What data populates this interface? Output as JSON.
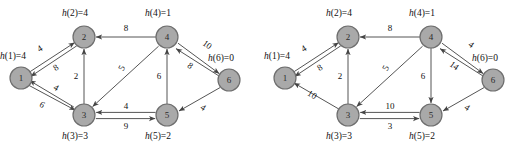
{
  "figure": {
    "caption": "",
    "node_fill": "#a9a9a9",
    "node_stroke": "#6e6e6e",
    "edge_color": "#555555"
  },
  "graphs": [
    {
      "id": "left",
      "nodes": [
        {
          "id": "1",
          "num": "1",
          "x": 21,
          "y": 78,
          "h_label": "h(1)=4",
          "label_x": 0,
          "label_y": 52
        },
        {
          "id": "2",
          "num": "2",
          "x": 84,
          "y": 37,
          "h_label": "h(2)=4",
          "label_x": 62,
          "label_y": 9
        },
        {
          "id": "3",
          "num": "3",
          "x": 84,
          "y": 115,
          "h_label": "h(3)=3",
          "label_x": 62,
          "label_y": 132
        },
        {
          "id": "4",
          "num": "4",
          "x": 167,
          "y": 37,
          "h_label": "h(4)=1",
          "label_x": 145,
          "label_y": 9
        },
        {
          "id": "5",
          "num": "5",
          "x": 167,
          "y": 115,
          "h_label": "h(5)=2",
          "label_x": 145,
          "label_y": 132
        },
        {
          "id": "6",
          "num": "6",
          "x": 229,
          "y": 80,
          "h_label": "h(6)=0",
          "label_x": 208,
          "label_y": 54
        }
      ],
      "edges": [
        {
          "from": "1",
          "to": "2",
          "weight": "4",
          "wx": 40,
          "wy": 49,
          "rot": -33
        },
        {
          "from": "2",
          "to": "1",
          "weight": "8",
          "wx": 56,
          "wy": 68,
          "rot": -33
        },
        {
          "from": "1",
          "to": "3",
          "weight": "6",
          "wx": 42,
          "wy": 105,
          "rot": 31
        },
        {
          "from": "3",
          "to": "1",
          "weight": "4",
          "wx": 56,
          "wy": 88,
          "rot": 31
        },
        {
          "from": "3",
          "to": "2",
          "weight": "2",
          "wx": 76,
          "wy": 76,
          "rot": 0
        },
        {
          "from": "4",
          "to": "2",
          "weight": "8",
          "wx": 126,
          "wy": 28,
          "rot": 0
        },
        {
          "from": "4",
          "to": "3",
          "weight": "5",
          "wx": 122,
          "wy": 68,
          "rot": -63
        },
        {
          "from": "5",
          "to": "4",
          "weight": "6",
          "wx": 159,
          "wy": 76,
          "rot": 0
        },
        {
          "from": "4",
          "to": "6",
          "weight": "10",
          "wx": 207,
          "wy": 45,
          "rot": 35
        },
        {
          "from": "6",
          "to": "4",
          "weight": "8",
          "wx": 190,
          "wy": 66,
          "rot": 35
        },
        {
          "from": "5",
          "to": "3",
          "weight": "4",
          "wx": 126,
          "wy": 106,
          "rot": 0
        },
        {
          "from": "3",
          "to": "5",
          "weight": "9",
          "wx": 126,
          "wy": 126,
          "rot": 0
        },
        {
          "from": "6",
          "to": "5",
          "weight": "4",
          "wx": 203,
          "wy": 108,
          "rot": 33
        }
      ]
    },
    {
      "id": "right",
      "nodes": [
        {
          "id": "1",
          "num": "1",
          "x": 21,
          "y": 78,
          "h_label": "h(1)=4",
          "label_x": 0,
          "label_y": 52
        },
        {
          "id": "2",
          "num": "2",
          "x": 84,
          "y": 37,
          "h_label": "h(2)=4",
          "label_x": 62,
          "label_y": 9
        },
        {
          "id": "3",
          "num": "3",
          "x": 84,
          "y": 115,
          "h_label": "h(3)=3",
          "label_x": 62,
          "label_y": 132
        },
        {
          "id": "4",
          "num": "4",
          "x": 167,
          "y": 37,
          "h_label": "h(4)=1",
          "label_x": 145,
          "label_y": 9
        },
        {
          "id": "5",
          "num": "5",
          "x": 167,
          "y": 115,
          "h_label": "h(5)=2",
          "label_x": 145,
          "label_y": 132
        },
        {
          "id": "6",
          "num": "6",
          "x": 229,
          "y": 80,
          "h_label": "h(6)=0",
          "label_x": 208,
          "label_y": 54
        }
      ],
      "edges": [
        {
          "from": "1",
          "to": "2",
          "weight": "4",
          "wx": 40,
          "wy": 49,
          "rot": -33
        },
        {
          "from": "2",
          "to": "1",
          "weight": "8",
          "wx": 56,
          "wy": 68,
          "rot": -33
        },
        {
          "from": "3",
          "to": "1",
          "weight": "10",
          "wx": 48,
          "wy": 95,
          "rot": 31
        },
        {
          "from": "3",
          "to": "2",
          "weight": "2",
          "wx": 76,
          "wy": 76,
          "rot": 0
        },
        {
          "from": "4",
          "to": "2",
          "weight": "8",
          "wx": 126,
          "wy": 28,
          "rot": 0
        },
        {
          "from": "4",
          "to": "3",
          "weight": "5",
          "wx": 122,
          "wy": 68,
          "rot": -63
        },
        {
          "from": "4",
          "to": "5",
          "weight": "6",
          "wx": 159,
          "wy": 76,
          "rot": 0
        },
        {
          "from": "4",
          "to": "6",
          "weight": "4",
          "wx": 207,
          "wy": 45,
          "rot": 35
        },
        {
          "from": "6",
          "to": "4",
          "weight": "14",
          "wx": 190,
          "wy": 66,
          "rot": 35
        },
        {
          "from": "5",
          "to": "3",
          "weight": "10",
          "wx": 126,
          "wy": 106,
          "rot": 0
        },
        {
          "from": "3",
          "to": "5",
          "weight": "3",
          "wx": 126,
          "wy": 126,
          "rot": 0
        },
        {
          "from": "6",
          "to": "5",
          "weight": "4",
          "wx": 203,
          "wy": 108,
          "rot": 33
        }
      ]
    }
  ]
}
